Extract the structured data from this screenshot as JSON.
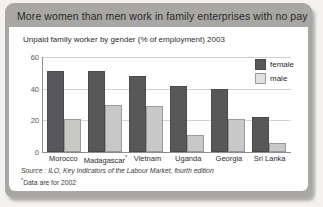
{
  "header": {
    "title": "More women than men work in family enterprises with no pay"
  },
  "notes": {
    "source": "Source : ILO, Key Indicators of the Labour Market, fourth edition",
    "footnote_marker": "*",
    "footnote": "Data are for 2002"
  },
  "legend": {
    "position": "top-right",
    "entries": [
      {
        "label": "female",
        "color": "#58585a"
      },
      {
        "label": "male",
        "color": "#e0e0de"
      }
    ]
  },
  "chart_data": {
    "type": "bar",
    "title": "Unpaid family worker by gender (% of employment) 2003",
    "xlabel": "",
    "ylabel": "",
    "ylim": [
      0,
      60
    ],
    "yticks": [
      0,
      20,
      40,
      60
    ],
    "grid": true,
    "categories": [
      "Morocco",
      "Madagascar*",
      "Vietnam",
      "Uganda",
      "Georgia",
      "Sri Lanka"
    ],
    "series": [
      {
        "name": "female",
        "color": "#58585a",
        "values": [
          51,
          51,
          48,
          42,
          40,
          22
        ]
      },
      {
        "name": "male",
        "color": "#c8c8c6",
        "values": [
          21,
          30,
          29,
          11,
          21,
          6
        ]
      }
    ]
  }
}
